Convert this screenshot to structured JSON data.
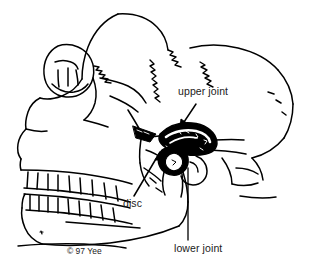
{
  "figure": {
    "width": 309,
    "height": 273,
    "background_color": "#ffffff",
    "ink_color": "#000000",
    "text_color": "#1a1a1a",
    "style": "black-and-white-line-drawing"
  },
  "labels": {
    "upper_joint": "upper joint",
    "disc": "disc",
    "lower_joint": "lower joint"
  },
  "credit": {
    "text": "© 97 Yee"
  },
  "leaders": {
    "upper_joint": "arrow-down-left",
    "disc": "arrow-up-right",
    "lower_joint": "vertical-line-up"
  },
  "icons": {
    "upper_joint_arrow": "arrow-icon",
    "disc_arrow": "arrow-icon",
    "lower_joint_leader": "leader-line-icon"
  }
}
